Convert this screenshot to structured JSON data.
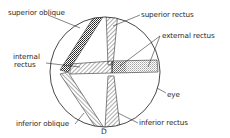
{
  "diagram": {
    "labels": {
      "superior_oblique": "superior oblique",
      "superior_rectus": "superior rectus",
      "external_rectus": "external rectus",
      "internal_rectus_line1": "internal",
      "internal_rectus_line2": "rectus",
      "eye": "eye",
      "inferior_oblique": "inferior oblique",
      "inferior_rectus": "inferior rectus",
      "point_d": "D"
    },
    "colors": {
      "line": "#333333",
      "background": "#ffffff"
    }
  }
}
